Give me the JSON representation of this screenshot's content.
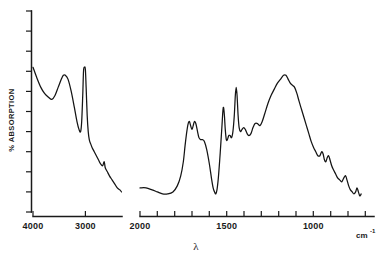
{
  "chart_data": {
    "type": "line",
    "title": "",
    "subtitle": "",
    "xlabel": "λ",
    "ylabel": "% ABSORPTION",
    "x_unit": "cm",
    "x_unit_exponent": "-1",
    "x_axis_direction": "decreasing",
    "xlim": [
      4000,
      650
    ],
    "ylim": [
      0,
      100
    ],
    "grid": false,
    "legend": null,
    "x_tick_labels": [
      "4000",
      "3000",
      "2000",
      "1500",
      "1000"
    ],
    "x_tick_values": [
      4000,
      3000,
      2000,
      1500,
      1000
    ],
    "y_tick_labels": [],
    "y_tick_count": 11,
    "axis_break": {
      "present": true,
      "from": 2300,
      "to": 2000,
      "note": "trace is split into two segments with a gap between 2300 and 2000 cm-1"
    },
    "series": [
      {
        "name": "segment-1",
        "x_range": [
          4000,
          2300
        ],
        "points": [
          [
            4000,
            72
          ],
          [
            3930,
            67
          ],
          [
            3850,
            62
          ],
          [
            3780,
            59
          ],
          [
            3700,
            57
          ],
          [
            3640,
            56
          ],
          [
            3580,
            58
          ],
          [
            3520,
            62
          ],
          [
            3460,
            66
          ],
          [
            3420,
            68
          ],
          [
            3380,
            68
          ],
          [
            3330,
            66
          ],
          [
            3270,
            60
          ],
          [
            3210,
            52
          ],
          [
            3160,
            45
          ],
          [
            3120,
            41
          ],
          [
            3090,
            40
          ],
          [
            3070,
            45
          ],
          [
            3050,
            58
          ],
          [
            3035,
            70
          ],
          [
            3020,
            72
          ],
          [
            3000,
            71
          ],
          [
            2985,
            62
          ],
          [
            2965,
            48
          ],
          [
            2945,
            40
          ],
          [
            2925,
            36
          ],
          [
            2900,
            34
          ],
          [
            2870,
            32
          ],
          [
            2830,
            30
          ],
          [
            2790,
            28
          ],
          [
            2750,
            26
          ],
          [
            2710,
            24
          ],
          [
            2670,
            23
          ],
          [
            2640,
            25
          ],
          [
            2620,
            22
          ],
          [
            2580,
            20
          ],
          [
            2540,
            18
          ],
          [
            2490,
            16
          ],
          [
            2440,
            14
          ],
          [
            2390,
            12
          ],
          [
            2340,
            11
          ],
          [
            2310,
            10
          ]
        ]
      },
      {
        "name": "segment-2",
        "x_range": [
          2000,
          660
        ],
        "points": [
          [
            2000,
            12
          ],
          [
            1965,
            12
          ],
          [
            1930,
            11
          ],
          [
            1900,
            10
          ],
          [
            1870,
            9
          ],
          [
            1840,
            9
          ],
          [
            1810,
            10
          ],
          [
            1785,
            13
          ],
          [
            1765,
            18
          ],
          [
            1750,
            25
          ],
          [
            1740,
            33
          ],
          [
            1730,
            40
          ],
          [
            1722,
            44
          ],
          [
            1715,
            45
          ],
          [
            1708,
            43
          ],
          [
            1700,
            41
          ],
          [
            1693,
            43
          ],
          [
            1686,
            45
          ],
          [
            1678,
            44
          ],
          [
            1668,
            40
          ],
          [
            1660,
            37
          ],
          [
            1650,
            36
          ],
          [
            1640,
            36
          ],
          [
            1628,
            35
          ],
          [
            1615,
            31
          ],
          [
            1600,
            24
          ],
          [
            1588,
            17
          ],
          [
            1578,
            12
          ],
          [
            1570,
            10
          ],
          [
            1563,
            9
          ],
          [
            1556,
            11
          ],
          [
            1548,
            17
          ],
          [
            1540,
            26
          ],
          [
            1533,
            35
          ],
          [
            1527,
            43
          ],
          [
            1522,
            50
          ],
          [
            1518,
            52
          ],
          [
            1513,
            48
          ],
          [
            1508,
            41
          ],
          [
            1502,
            36
          ],
          [
            1496,
            36
          ],
          [
            1488,
            38
          ],
          [
            1480,
            38
          ],
          [
            1472,
            37
          ],
          [
            1464,
            40
          ],
          [
            1456,
            48
          ],
          [
            1450,
            58
          ],
          [
            1445,
            62
          ],
          [
            1440,
            58
          ],
          [
            1434,
            48
          ],
          [
            1428,
            42
          ],
          [
            1420,
            40
          ],
          [
            1412,
            41
          ],
          [
            1402,
            42
          ],
          [
            1392,
            41
          ],
          [
            1382,
            39
          ],
          [
            1372,
            38
          ],
          [
            1360,
            39
          ],
          [
            1348,
            42
          ],
          [
            1336,
            44
          ],
          [
            1322,
            44
          ],
          [
            1308,
            43
          ],
          [
            1295,
            45
          ],
          [
            1280,
            49
          ],
          [
            1262,
            54
          ],
          [
            1244,
            58
          ],
          [
            1226,
            61
          ],
          [
            1208,
            64
          ],
          [
            1190,
            66
          ],
          [
            1172,
            68
          ],
          [
            1158,
            68
          ],
          [
            1145,
            66
          ],
          [
            1132,
            64
          ],
          [
            1120,
            63
          ],
          [
            1108,
            62
          ],
          [
            1095,
            59
          ],
          [
            1082,
            55
          ],
          [
            1068,
            51
          ],
          [
            1054,
            47
          ],
          [
            1040,
            43
          ],
          [
            1026,
            39
          ],
          [
            1012,
            35
          ],
          [
            998,
            32
          ],
          [
            986,
            30
          ],
          [
            974,
            28
          ],
          [
            962,
            28
          ],
          [
            952,
            30
          ],
          [
            944,
            29
          ],
          [
            936,
            26
          ],
          [
            928,
            25
          ],
          [
            920,
            27
          ],
          [
            912,
            28
          ],
          [
            904,
            26
          ],
          [
            894,
            23
          ],
          [
            884,
            21
          ],
          [
            872,
            19
          ],
          [
            860,
            17
          ],
          [
            848,
            16
          ],
          [
            836,
            15
          ],
          [
            824,
            17
          ],
          [
            814,
            18
          ],
          [
            806,
            16
          ],
          [
            796,
            13
          ],
          [
            786,
            11
          ],
          [
            776,
            10
          ],
          [
            766,
            9
          ],
          [
            756,
            10
          ],
          [
            748,
            12
          ],
          [
            740,
            10
          ],
          [
            732,
            8
          ],
          [
            724,
            9
          ]
        ]
      }
    ],
    "annotations": []
  }
}
